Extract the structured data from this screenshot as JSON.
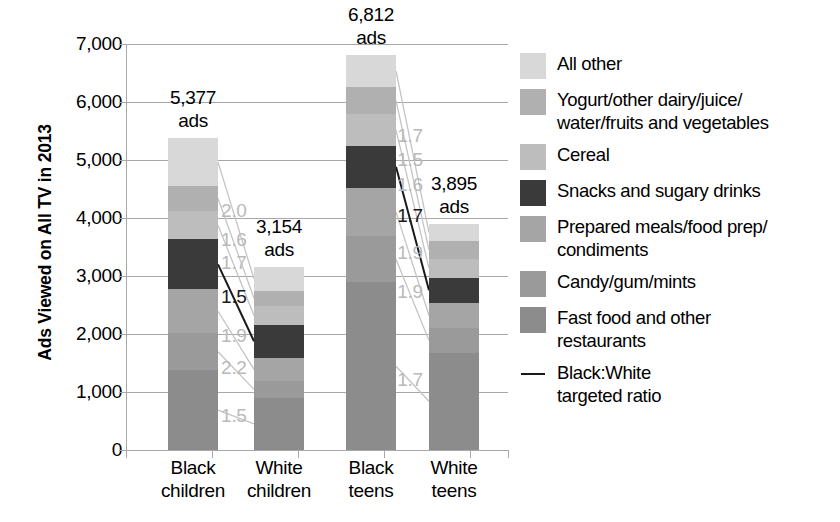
{
  "chart_data": {
    "type": "bar",
    "subtype": "stacked-bar-with-ratio-connectors",
    "title": "",
    "xlabel": "",
    "ylabel": "Ads Viewed on All TV in 2013",
    "ylim": [
      0,
      7000
    ],
    "ytick_values": [
      0,
      1000,
      2000,
      3000,
      4000,
      5000,
      6000,
      7000
    ],
    "ytick_labels": [
      "0",
      "1,000",
      "2,000",
      "3,000",
      "4,000",
      "5,000",
      "6,000",
      "7,000"
    ],
    "grid": true,
    "legend_position": "right",
    "categories": [
      "Black children",
      "White children",
      "Black teens",
      "White teens"
    ],
    "category_lines": [
      [
        "Black",
        "children"
      ],
      [
        "White",
        "children"
      ],
      [
        "Black",
        "teens"
      ],
      [
        "White",
        "teens"
      ]
    ],
    "totals": [
      5377,
      3154,
      6812,
      3895
    ],
    "total_labels": [
      "5,377",
      "3,154",
      "6,812",
      "3,895"
    ],
    "total_label_unit": "ads",
    "series": [
      {
        "name": "Fast food and other restaurants",
        "key": "fast_food",
        "color": "#8c8c8c",
        "values": [
          1375,
          900,
          2890,
          1680
        ]
      },
      {
        "name": "Candy/gum/mints",
        "key": "candy",
        "color": "#9a9a9a",
        "values": [
          640,
          290,
          800,
          420
        ]
      },
      {
        "name": "Prepared meals/food prep/condiments",
        "key": "prepared",
        "color": "#a5a5a5",
        "values": [
          755,
          400,
          830,
          440
        ]
      },
      {
        "name": "Snacks and sugary drinks",
        "key": "snacks",
        "color": "#3a3a3a",
        "values": [
          860,
          570,
          730,
          430
        ]
      },
      {
        "name": "Cereal",
        "key": "cereal",
        "color": "#bdbdbd",
        "values": [
          490,
          320,
          540,
          330
        ]
      },
      {
        "name": "Yogurt/other dairy/juice/water/fruits and vegetables",
        "key": "yogurt",
        "color": "#b0b0b0",
        "values": [
          430,
          270,
          470,
          300
        ]
      },
      {
        "name": "All other",
        "key": "all_other",
        "color": "#d8d8d8",
        "values": [
          827,
          404,
          552,
          295
        ]
      }
    ],
    "ratio_label_note": "Black:White targeted ratio connecting matching segments",
    "ratio_groups": [
      {
        "pair": "children",
        "from_category": "Black children",
        "to_category": "White children",
        "ratios_bottom_to_top": [
          1.5,
          2.2,
          1.9,
          1.5,
          1.7,
          1.6,
          2.0
        ],
        "ratio_labels_bottom_to_top": [
          "1.5",
          "2.2",
          "1.9",
          "1.5",
          "1.7",
          "1.6",
          "2.0"
        ],
        "emphasized_ratio": "1.5"
      },
      {
        "pair": "teens",
        "from_category": "Black teens",
        "to_category": "White teens",
        "ratios_bottom_to_top": [
          1.7,
          1.9,
          1.9,
          1.7,
          1.6,
          1.5,
          1.7
        ],
        "ratio_labels_bottom_to_top": [
          "1.7",
          "1.9",
          "1.9",
          "1.7",
          "1.6",
          "1.5",
          "1.7"
        ],
        "emphasized_ratio": "1.7"
      }
    ]
  },
  "legend": {
    "items": [
      {
        "label": "All other",
        "color": "#d8d8d8",
        "type": "swatch"
      },
      {
        "label": "Yogurt/other dairy/juice/\nwater/fruits and vegetables",
        "color": "#b0b0b0",
        "type": "swatch"
      },
      {
        "label": "Cereal",
        "color": "#bdbdbd",
        "type": "swatch"
      },
      {
        "label": "Snacks and sugary drinks",
        "color": "#3a3a3a",
        "type": "swatch"
      },
      {
        "label": "Prepared meals/food prep/\ncondiments",
        "color": "#a5a5a5",
        "type": "swatch"
      },
      {
        "label": "Candy/gum/mints",
        "color": "#9a9a9a",
        "type": "swatch"
      },
      {
        "label": "Fast food and other\nrestaurants",
        "color": "#8c8c8c",
        "type": "swatch"
      },
      {
        "label": "Black:White\ntargeted ratio",
        "color": "#1a1a1a",
        "type": "line"
      }
    ]
  },
  "colors": {
    "gridline": "#a8a8a8",
    "ratio_connector": "#c4c4c4",
    "ratio_connector_dark": "#1a1a1a",
    "text": "#000000"
  }
}
